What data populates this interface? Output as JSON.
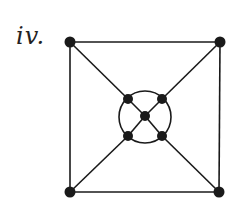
{
  "figure": {
    "label": "iv.",
    "ink_color": "#1a1a1a",
    "graph": {
      "nodes": [
        {
          "id": "outer-top-left"
        },
        {
          "id": "outer-top-right"
        },
        {
          "id": "outer-bottom-left"
        },
        {
          "id": "outer-bottom-right"
        },
        {
          "id": "inner-top-left"
        },
        {
          "id": "inner-top-right"
        },
        {
          "id": "inner-center"
        },
        {
          "id": "inner-bottom-left"
        },
        {
          "id": "inner-bottom-right"
        }
      ],
      "edges": [
        [
          "outer-top-left",
          "outer-top-right"
        ],
        [
          "outer-top-right",
          "outer-bottom-right"
        ],
        [
          "outer-bottom-right",
          "outer-bottom-left"
        ],
        [
          "outer-bottom-left",
          "outer-top-left"
        ],
        [
          "outer-top-left",
          "inner-top-left"
        ],
        [
          "outer-top-right",
          "inner-top-right"
        ],
        [
          "outer-bottom-left",
          "inner-bottom-left"
        ],
        [
          "outer-bottom-right",
          "inner-bottom-right"
        ],
        [
          "inner-top-left",
          "inner-center"
        ],
        [
          "inner-top-right",
          "inner-center"
        ],
        [
          "inner-bottom-left",
          "inner-center"
        ],
        [
          "inner-bottom-right",
          "inner-center"
        ]
      ],
      "inner_cycle": [
        "inner-top-left",
        "inner-top-right",
        "inner-bottom-right",
        "inner-bottom-left"
      ]
    }
  }
}
